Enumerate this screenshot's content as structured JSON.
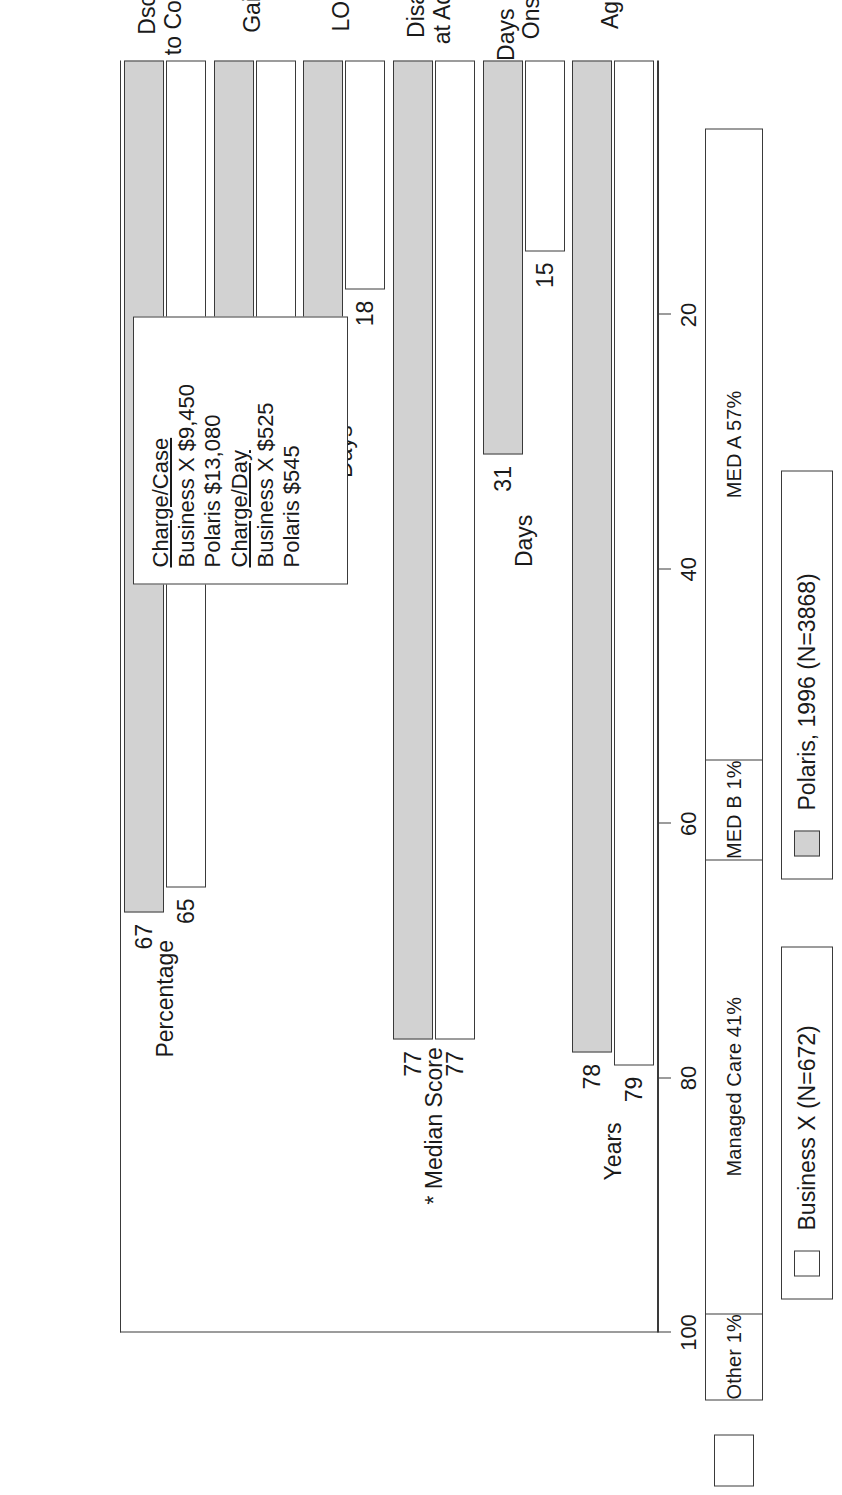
{
  "payer_mix": {
    "segments": [
      {
        "label": "MED A 57%",
        "value": 57
      },
      {
        "label": "MED B 1%",
        "value": 1
      },
      {
        "label": "Managed Care 41%",
        "value": 41
      },
      {
        "label": "Other 1%",
        "value": 1
      }
    ]
  },
  "legend": [
    {
      "label": "Business X (N=672)",
      "swatch": "#ffffff"
    },
    {
      "label": "Polaris, 1996 (N=3868)",
      "swatch": "#d2d2d2"
    }
  ],
  "stats_box": {
    "lines": [
      {
        "text": "Charge/Case",
        "header": true
      },
      {
        "text": "Business X $9,450",
        "header": false
      },
      {
        "text": "Polaris $13,080",
        "header": false
      },
      {
        "text": "Charge/Day",
        "header": true
      },
      {
        "text": "Business X $525",
        "header": false
      },
      {
        "text": "Polaris $545",
        "header": false
      }
    ]
  },
  "chart_data": {
    "type": "bar",
    "title": "",
    "xlabel": "",
    "ylabel": "",
    "ylim": [
      0,
      100
    ],
    "grid": false,
    "legend_position": "bottom",
    "ticks": [
      "100",
      "80",
      "60",
      "40",
      "20"
    ],
    "tick_values": [
      100,
      80,
      60,
      40,
      20
    ],
    "categories": [
      "Age",
      "Days Post\nOnset",
      "Disab\nat Adm",
      "LOS",
      "Gain",
      "Dsch\nto Comm"
    ],
    "units": [
      "Years",
      "Days",
      "* Median Score",
      "Days",
      "* Median Score",
      "Percentage"
    ],
    "series": [
      {
        "name": "Business X (N=672)",
        "values": [
          79,
          15,
          77,
          18,
          21,
          65
        ]
      },
      {
        "name": "Polaris, 1996 (N=3868)",
        "values": [
          78,
          31,
          77,
          24,
          22,
          67
        ]
      }
    ]
  }
}
